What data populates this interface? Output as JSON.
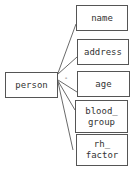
{
  "diagram": {
    "root": {
      "label": "person"
    },
    "attributes": [
      {
        "label": "name"
      },
      {
        "label": "address"
      },
      {
        "label": "age"
      },
      {
        "label": "blood_\ngroup"
      },
      {
        "label": "rh_\nfactor"
      }
    ],
    "dash_mark": "-"
  }
}
